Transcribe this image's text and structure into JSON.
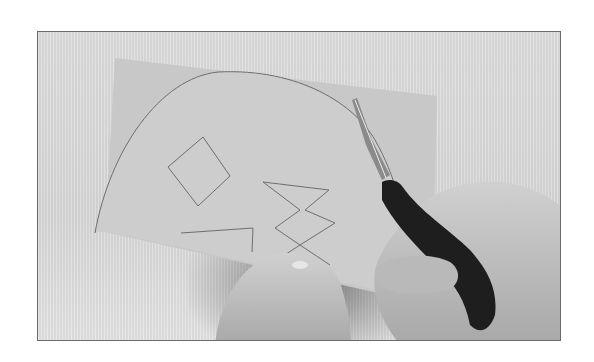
{
  "image": {
    "description": "Grayscale photo of hands holding a rectangular sheet of paper and cutting along a drawn arc with black-handled scissors. Drawn shapes on the paper: a large arc, a diamond, a zig-zag pattern and an angled line.",
    "colors": {
      "background": "#ffffff",
      "frame_border": "#6a6a6a",
      "backdrop": "#d8d8d8",
      "paper": "#c9c9c9",
      "paper_cut_region": "#cfcfcf",
      "pencil_line": "#6e6e6e",
      "skin": "#bdbdbd",
      "scissor_handle": "#1e1e1e",
      "scissor_blade": "#8a8a8a"
    }
  }
}
